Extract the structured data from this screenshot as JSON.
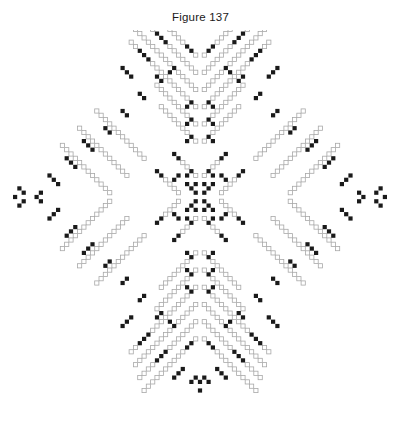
{
  "figure": {
    "caption": "Figure 137",
    "title_color": "#1a1a1a",
    "background_color": "#ffffff"
  },
  "pattern": {
    "name": "cruciform-beadwork-medallion",
    "description": "Four-pointed cross / star beadwork charting diagram built on a diagonal bead lattice with four-fold mirror symmetry.",
    "symmetry": "4-fold mirror (horizontal and vertical axes)",
    "bead_shapes": [
      "filled",
      "open"
    ],
    "filled_color": "#1a1a1a",
    "open_fill_color": "#ffffff",
    "open_stroke_color": "#a8a8a8",
    "bead_size_px": 4.2,
    "grid_pitch_px": 4.3,
    "center_x_px": 200,
    "center_y_px": 197,
    "extent_x_px": 168,
    "extent_y_px": 188,
    "counts": {
      "filled_beads": 470,
      "open_beads": 560
    },
    "quadrant_segments": [
      {
        "type": "filled",
        "x0": 0,
        "y0": 43,
        "dx": 1,
        "dy": -1,
        "n": 1
      },
      {
        "type": "filled",
        "x0": 1,
        "y0": 42,
        "dx": 1,
        "dy": 1,
        "n": 2
      },
      {
        "type": "filled",
        "x0": 0,
        "y0": 45,
        "dx": 1,
        "dy": 1,
        "n": 1
      },
      {
        "type": "filled",
        "x0": 4,
        "y0": 40,
        "dx": 1,
        "dy": 1,
        "n": 3
      },
      {
        "type": "filled",
        "x0": 8,
        "y0": 36,
        "dx": 1,
        "dy": 1,
        "n": 3
      },
      {
        "type": "filled",
        "x0": 12,
        "y0": 32,
        "dx": 1,
        "dy": 1,
        "n": 3
      },
      {
        "type": "filled",
        "x0": 16,
        "y0": 28,
        "dx": 1,
        "dy": 1,
        "n": 3
      },
      {
        "type": "filled",
        "x0": 2,
        "y0": 34,
        "dx": 1,
        "dy": 1,
        "n": 2
      },
      {
        "type": "filled",
        "x0": 6,
        "y0": 30,
        "dx": 1,
        "dy": -1,
        "n": 2
      },
      {
        "type": "open",
        "x0": 1,
        "y0": 33,
        "dx": 1,
        "dy": 1,
        "n": 13
      },
      {
        "type": "open",
        "x0": 1,
        "y0": 29,
        "dx": 1,
        "dy": 1,
        "n": 14
      },
      {
        "type": "open",
        "x0": 1,
        "y0": 25,
        "dx": 1,
        "dy": 1,
        "n": 15
      },
      {
        "type": "open",
        "x0": 1,
        "y0": 21,
        "dx": 1,
        "dy": 1,
        "n": 16
      },
      {
        "type": "filled",
        "x0": 9,
        "y0": 27,
        "dx": 1,
        "dy": 1,
        "n": 2
      },
      {
        "type": "filled",
        "x0": 13,
        "y0": 23,
        "dx": 1,
        "dy": 1,
        "n": 2
      },
      {
        "type": "filled",
        "x0": 17,
        "y0": 19,
        "dx": 1,
        "dy": 1,
        "n": 2
      },
      {
        "type": "filled",
        "x0": 21,
        "y0": 15,
        "dx": 1,
        "dy": 1,
        "n": 2
      },
      {
        "type": "filled",
        "x0": 2,
        "y0": 22,
        "dx": 1,
        "dy": -1,
        "n": 2
      },
      {
        "type": "filled",
        "x0": 2,
        "y0": 18,
        "dx": 1,
        "dy": -1,
        "n": 2
      },
      {
        "type": "filled",
        "x0": 2,
        "y0": 14,
        "dx": 1,
        "dy": -1,
        "n": 2
      },
      {
        "type": "open",
        "x0": 1,
        "y0": 17,
        "dx": 1,
        "dy": 1,
        "n": 10
      },
      {
        "type": "open",
        "x0": 1,
        "y0": 13,
        "dx": 1,
        "dy": 1,
        "n": 9
      },
      {
        "type": "filled",
        "x0": 25,
        "y0": 11,
        "dx": 1,
        "dy": 1,
        "n": 3
      },
      {
        "type": "filled",
        "x0": 29,
        "y0": 7,
        "dx": 1,
        "dy": 1,
        "n": 3
      },
      {
        "type": "filled",
        "x0": 33,
        "y0": 3,
        "dx": 1,
        "dy": 1,
        "n": 3
      },
      {
        "type": "filled",
        "x0": 37,
        "y0": 1,
        "dx": 1,
        "dy": -1,
        "n": 2
      },
      {
        "type": "filled",
        "x0": 41,
        "y0": 1,
        "dx": 1,
        "dy": 1,
        "n": 2
      },
      {
        "type": "filled",
        "x0": 43,
        "y0": 0,
        "dx": 1,
        "dy": 1,
        "n": 1
      },
      {
        "type": "open",
        "x0": 13,
        "y0": 9,
        "dx": 1,
        "dy": 1,
        "n": 12
      },
      {
        "type": "open",
        "x0": 17,
        "y0": 5,
        "dx": 1,
        "dy": 1,
        "n": 12
      },
      {
        "type": "open",
        "x0": 21,
        "y0": 1,
        "dx": 1,
        "dy": 1,
        "n": 12
      },
      {
        "type": "filled",
        "x0": 5,
        "y0": 9,
        "dx": 1,
        "dy": 1,
        "n": 2
      },
      {
        "type": "filled",
        "x0": 9,
        "y0": 5,
        "dx": 1,
        "dy": 1,
        "n": 2
      },
      {
        "type": "filled",
        "x0": 5,
        "y0": 5,
        "dx": 1,
        "dy": -1,
        "n": 2
      },
      {
        "type": "filled",
        "x0": 2,
        "y0": 2,
        "dx": 1,
        "dy": 1,
        "n": 2
      },
      {
        "type": "filled",
        "x0": 2,
        "y0": 6,
        "dx": 1,
        "dy": -1,
        "n": 2
      },
      {
        "type": "open",
        "x0": 5,
        "y0": 1,
        "dx": 1,
        "dy": 1,
        "n": 6
      },
      {
        "type": "open",
        "x0": 1,
        "y0": 5,
        "dx": 1,
        "dy": 1,
        "n": 5
      },
      {
        "type": "filled",
        "x0": 1,
        "y0": 1,
        "dx": 1,
        "dy": 1,
        "n": 1
      },
      {
        "type": "filled",
        "x0": 1,
        "y0": 3,
        "dx": 1,
        "dy": -1,
        "n": 1
      }
    ]
  },
  "tools": {
    "zoom_level": "100%"
  }
}
